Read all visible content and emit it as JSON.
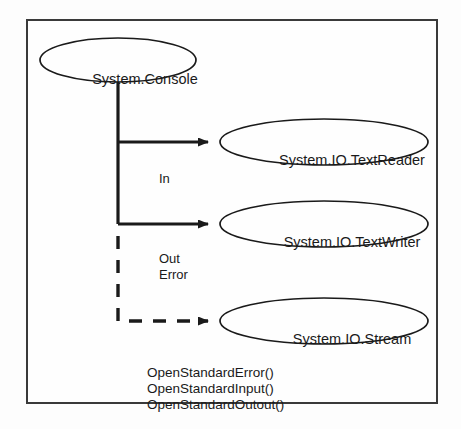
{
  "diagram": {
    "type": "class-relationship-diagram",
    "colors": {
      "line": "#1a1a1a",
      "frame": "#3a3a3a",
      "background": "#fefefe",
      "text": "#1a1a1a"
    },
    "nodes": [
      {
        "id": "console",
        "label": "System.Console",
        "shape": "ellipse"
      },
      {
        "id": "textreader",
        "label": "System.IO.TextReader",
        "shape": "ellipse"
      },
      {
        "id": "textwriter",
        "label": "System.IO.TextWriter",
        "shape": "ellipse"
      },
      {
        "id": "stream",
        "label": "System.IO.Stream",
        "shape": "ellipse"
      }
    ],
    "edges": [
      {
        "from": "console",
        "to": "textreader",
        "label": "In",
        "style": "solid",
        "arrow": "filled"
      },
      {
        "from": "console",
        "to": "textwriter",
        "label": "Out",
        "style": "solid",
        "arrow": "filled"
      },
      {
        "from": "console",
        "to": "textwriter",
        "label": "Error",
        "style": "solid",
        "arrow": "filled"
      },
      {
        "from": "console",
        "to": "stream",
        "label": "",
        "style": "dashed",
        "arrow": "filled"
      }
    ],
    "methods": [
      "OpenStandardError()",
      "OpenStandardInput()",
      "OpenStandardOutout()"
    ]
  }
}
